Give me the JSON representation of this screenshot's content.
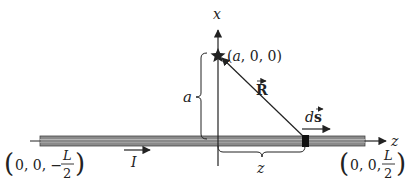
{
  "diagram": {
    "type": "physics-field-geometry",
    "axes": {
      "x_label": "x",
      "z_label": "z"
    },
    "point": {
      "label": "(a, 0, 0)",
      "marker": "star-icon"
    },
    "vectors": {
      "R_label": "R",
      "ds_label": "ds",
      "current_label": "I"
    },
    "dimensions": {
      "a_label": "a",
      "z_label": "z"
    },
    "endpoints": {
      "left": {
        "prefix": "0, 0, −",
        "num": "L",
        "den": "2"
      },
      "right": {
        "prefix": "0, 0,",
        "num": "L",
        "den": "2"
      }
    },
    "colors": {
      "wire_fill": "#8a8a8a",
      "wire_stripe": "#b5b5b5",
      "ink": "#222222",
      "element": "#111111"
    }
  }
}
